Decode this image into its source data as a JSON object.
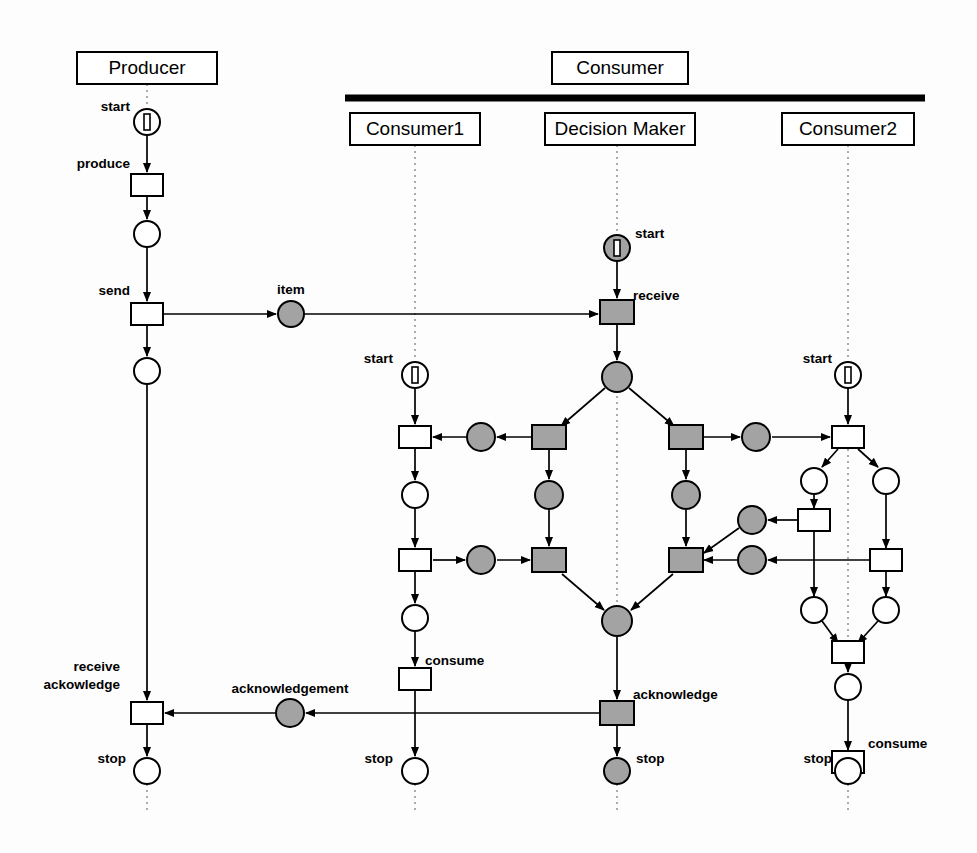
{
  "diagram": {
    "type": "petri-net",
    "colors": {
      "gray_fill": "#a3a3a3",
      "white_fill": "#ffffff",
      "stroke": "#000000",
      "lifeline": "#888888"
    }
  },
  "lanes": [
    {
      "id": "producer",
      "label": "Producer",
      "x": 147,
      "y": 68,
      "w": 140,
      "h": 32
    },
    {
      "id": "consumer",
      "label": "Consumer",
      "x": 620,
      "y": 68,
      "w": 136,
      "h": 32
    },
    {
      "id": "consumer1",
      "label": "Consumer1",
      "x": 415,
      "y": 129,
      "w": 130,
      "h": 32
    },
    {
      "id": "decision-maker",
      "label": "Decision Maker",
      "x": 620,
      "y": 129,
      "w": 150,
      "h": 32
    },
    {
      "id": "consumer2",
      "label": "Consumer2",
      "x": 848,
      "y": 129,
      "w": 132,
      "h": 32
    }
  ],
  "consumer_bar": {
    "x1": 345,
    "x2": 925,
    "y": 98,
    "thickness": 7
  },
  "labels": [
    {
      "id": "producer-start",
      "text": "start",
      "x": 130,
      "y": 111,
      "align": "end"
    },
    {
      "id": "producer-produce",
      "text": "produce",
      "x": 130,
      "y": 168,
      "align": "end"
    },
    {
      "id": "producer-send",
      "text": "send",
      "x": 130,
      "y": 295,
      "align": "end"
    },
    {
      "id": "item-place",
      "text": "item",
      "x": 291,
      "y": 294,
      "align": "middle"
    },
    {
      "id": "dm-start",
      "text": "start",
      "x": 635,
      "y": 238,
      "align": "start"
    },
    {
      "id": "dm-receive",
      "text": "receive",
      "x": 633,
      "y": 300,
      "align": "start"
    },
    {
      "id": "c1-start",
      "text": "start",
      "x": 393,
      "y": 363,
      "align": "end"
    },
    {
      "id": "c2-start",
      "text": "start",
      "x": 832,
      "y": 363,
      "align": "end"
    },
    {
      "id": "c1-consume",
      "text": "consume",
      "x": 425,
      "y": 665,
      "align": "start"
    },
    {
      "id": "c2-consume",
      "text": "consume",
      "x": 868,
      "y": 748,
      "align": "start"
    },
    {
      "id": "prod-receive-ack-1",
      "text": "receive",
      "x": 120,
      "y": 671,
      "align": "end"
    },
    {
      "id": "prod-receive-ack-2",
      "text": "ackowledge",
      "x": 120,
      "y": 689,
      "align": "end"
    },
    {
      "id": "ack-place",
      "text": "acknowledgement",
      "x": 290,
      "y": 693,
      "align": "middle"
    },
    {
      "id": "dm-acknowledge",
      "text": "acknowledge",
      "x": 633,
      "y": 699,
      "align": "start"
    },
    {
      "id": "prod-stop",
      "text": "stop",
      "x": 126,
      "y": 763,
      "align": "end"
    },
    {
      "id": "c1-stop",
      "text": "stop",
      "x": 393,
      "y": 763,
      "align": "end"
    },
    {
      "id": "dm-stop",
      "text": "stop",
      "x": 636,
      "y": 763,
      "align": "start"
    },
    {
      "id": "c2-stop",
      "text": "stop",
      "x": 832,
      "y": 763,
      "align": "end"
    }
  ],
  "lifelines": [
    {
      "id": "lifeline-producer",
      "x": 147,
      "y1": 84,
      "y2": 104
    },
    {
      "id": "lifeline-consumer1",
      "x": 415,
      "y1": 145,
      "y2": 372
    },
    {
      "id": "lifeline-dm",
      "x": 617,
      "y1": 145,
      "y2": 248
    },
    {
      "id": "lifeline-consumer2",
      "x": 848,
      "y1": 145,
      "y2": 372
    },
    {
      "id": "lifeline-dm-mid",
      "x": 617,
      "y1": 378,
      "y2": 624
    },
    {
      "id": "lifeline-c2-mid",
      "x": 848,
      "y1": 443,
      "y2": 652
    },
    {
      "id": "lifeline-prod-end",
      "x": 147,
      "y1": 784,
      "y2": 812
    },
    {
      "id": "lifeline-c1-end",
      "x": 415,
      "y1": 784,
      "y2": 812
    },
    {
      "id": "lifeline-dm-end",
      "x": 617,
      "y1": 784,
      "y2": 812
    },
    {
      "id": "lifeline-c2-end",
      "x": 848,
      "y1": 784,
      "y2": 812
    }
  ],
  "places": [
    {
      "id": "p-prod-start",
      "cx": 147,
      "cy": 122,
      "r": 13,
      "fill": "white",
      "token": "bar"
    },
    {
      "id": "p-prod-1",
      "cx": 147,
      "cy": 234,
      "r": 13,
      "fill": "white",
      "token": "none"
    },
    {
      "id": "p-prod-2",
      "cx": 147,
      "cy": 371,
      "r": 13,
      "fill": "white",
      "token": "none"
    },
    {
      "id": "p-item",
      "cx": 291,
      "cy": 314,
      "r": 13,
      "fill": "gray",
      "token": "none"
    },
    {
      "id": "p-dm-start",
      "cx": 617,
      "cy": 248,
      "r": 13,
      "fill": "gray",
      "token": "bar"
    },
    {
      "id": "p-dm-fork",
      "cx": 617,
      "cy": 377,
      "r": 15,
      "fill": "gray",
      "token": "none"
    },
    {
      "id": "p-c1-start",
      "cx": 415,
      "cy": 375,
      "r": 13,
      "fill": "white",
      "token": "bar"
    },
    {
      "id": "p-c2-start",
      "cx": 848,
      "cy": 375,
      "r": 13,
      "fill": "white",
      "token": "bar"
    },
    {
      "id": "p-c1-a",
      "cx": 481,
      "cy": 437,
      "r": 14,
      "fill": "gray",
      "token": "none"
    },
    {
      "id": "p-c1-b",
      "cx": 415,
      "cy": 495,
      "r": 13,
      "fill": "white",
      "token": "none"
    },
    {
      "id": "p-c1-c",
      "cx": 481,
      "cy": 560,
      "r": 14,
      "fill": "gray",
      "token": "none"
    },
    {
      "id": "p-c1-d",
      "cx": 415,
      "cy": 618,
      "r": 13,
      "fill": "white",
      "token": "none"
    },
    {
      "id": "p-dm-l-mid",
      "cx": 549,
      "cy": 495,
      "r": 14,
      "fill": "gray",
      "token": "none"
    },
    {
      "id": "p-dm-r-mid",
      "cx": 686,
      "cy": 495,
      "r": 14,
      "fill": "gray",
      "token": "none"
    },
    {
      "id": "p-c2-a",
      "cx": 756,
      "cy": 437,
      "r": 14,
      "fill": "gray",
      "token": "none"
    },
    {
      "id": "p-c2-b",
      "cx": 752,
      "cy": 520,
      "r": 14,
      "fill": "gray",
      "token": "none"
    },
    {
      "id": "p-c2-c",
      "cx": 752,
      "cy": 560,
      "r": 14,
      "fill": "gray",
      "token": "none"
    },
    {
      "id": "p-c2-l1",
      "cx": 814,
      "cy": 481,
      "r": 13,
      "fill": "white",
      "token": "none"
    },
    {
      "id": "p-c2-r1",
      "cx": 886,
      "cy": 481,
      "r": 13,
      "fill": "white",
      "token": "none"
    },
    {
      "id": "p-c2-l2",
      "cx": 814,
      "cy": 610,
      "r": 13,
      "fill": "white",
      "token": "none"
    },
    {
      "id": "p-c2-r2",
      "cx": 886,
      "cy": 610,
      "r": 13,
      "fill": "white",
      "token": "none"
    },
    {
      "id": "p-c2-join",
      "cx": 848,
      "cy": 687,
      "r": 13,
      "fill": "white",
      "token": "none"
    },
    {
      "id": "p-dm-join",
      "cx": 617,
      "cy": 621,
      "r": 15,
      "fill": "gray",
      "token": "none"
    },
    {
      "id": "p-ack",
      "cx": 290,
      "cy": 713,
      "r": 14,
      "fill": "gray",
      "token": "none"
    },
    {
      "id": "p-prod-stop",
      "cx": 147,
      "cy": 771,
      "r": 13,
      "fill": "white",
      "token": "none"
    },
    {
      "id": "p-c1-stop",
      "cx": 415,
      "cy": 771,
      "r": 13,
      "fill": "white",
      "token": "none"
    },
    {
      "id": "p-dm-stop",
      "cx": 617,
      "cy": 771,
      "r": 13,
      "fill": "gray",
      "token": "none"
    },
    {
      "id": "p-c2-stop",
      "cx": 848,
      "cy": 771,
      "r": 13,
      "fill": "white",
      "token": "none"
    }
  ],
  "transitions": [
    {
      "id": "t-produce",
      "cx": 147,
      "cy": 185,
      "w": 32,
      "h": 22,
      "fill": "white"
    },
    {
      "id": "t-send",
      "cx": 147,
      "cy": 314,
      "w": 32,
      "h": 22,
      "fill": "white"
    },
    {
      "id": "t-receive",
      "cx": 617,
      "cy": 312,
      "w": 34,
      "h": 24,
      "fill": "gray"
    },
    {
      "id": "t-c1-1",
      "cx": 415,
      "cy": 437,
      "w": 32,
      "h": 22,
      "fill": "white"
    },
    {
      "id": "t-c1-2",
      "cx": 415,
      "cy": 560,
      "w": 32,
      "h": 22,
      "fill": "white"
    },
    {
      "id": "t-dm-l-top",
      "cx": 549,
      "cy": 437,
      "w": 34,
      "h": 24,
      "fill": "gray"
    },
    {
      "id": "t-dm-l-bot",
      "cx": 549,
      "cy": 560,
      "w": 34,
      "h": 24,
      "fill": "gray"
    },
    {
      "id": "t-dm-r-top",
      "cx": 686,
      "cy": 437,
      "w": 34,
      "h": 24,
      "fill": "gray"
    },
    {
      "id": "t-dm-r-bot",
      "cx": 686,
      "cy": 560,
      "w": 34,
      "h": 24,
      "fill": "gray"
    },
    {
      "id": "t-c2-1",
      "cx": 848,
      "cy": 437,
      "w": 32,
      "h": 22,
      "fill": "white"
    },
    {
      "id": "t-c2-left",
      "cx": 814,
      "cy": 520,
      "w": 32,
      "h": 22,
      "fill": "white"
    },
    {
      "id": "t-c2-right",
      "cx": 886,
      "cy": 560,
      "w": 32,
      "h": 22,
      "fill": "white"
    },
    {
      "id": "t-c2-join",
      "cx": 848,
      "cy": 652,
      "w": 32,
      "h": 22,
      "fill": "white"
    },
    {
      "id": "t-c1-consume",
      "cx": 415,
      "cy": 679,
      "w": 32,
      "h": 22,
      "fill": "white"
    },
    {
      "id": "t-c2-consume",
      "cx": 848,
      "cy": 762,
      "w": 32,
      "h": 22,
      "fill": "white"
    },
    {
      "id": "t-dm-ack",
      "cx": 617,
      "cy": 713,
      "w": 34,
      "h": 24,
      "fill": "gray"
    },
    {
      "id": "t-prod-recack",
      "cx": 147,
      "cy": 713,
      "w": 32,
      "h": 22,
      "fill": "white"
    }
  ],
  "arcs": [
    {
      "id": "a-prodstart-produce",
      "d": "M147,135 L147,172",
      "arrow": true
    },
    {
      "id": "a-produce-p1",
      "d": "M147,196 L147,219",
      "arrow": true
    },
    {
      "id": "a-p1-send",
      "d": "M147,247 L147,301",
      "arrow": true
    },
    {
      "id": "a-send-p2",
      "d": "M147,325 L147,356",
      "arrow": true
    },
    {
      "id": "a-send-item",
      "d": "M163,314 L276,314",
      "arrow": true
    },
    {
      "id": "a-item-receive",
      "d": "M304,314 L598,314",
      "arrow": true
    },
    {
      "id": "a-dmstart-receive",
      "d": "M617,261 L617,298",
      "arrow": true
    },
    {
      "id": "a-receive-fork",
      "d": "M617,324 L617,360",
      "arrow": true
    },
    {
      "id": "a-p2-recack",
      "d": "M147,384 L147,700",
      "arrow": true
    },
    {
      "id": "a-fork-dmltop",
      "d": "M605,388 L561,426",
      "arrow": true
    },
    {
      "id": "a-fork-dmrtop",
      "d": "M629,388 L674,426",
      "arrow": true
    },
    {
      "id": "a-dmltop-pc1a",
      "d": "M532,437 L497,437",
      "arrow": true
    },
    {
      "id": "a-pc1a-tc11",
      "d": "M466,437 L433,437",
      "arrow": true
    },
    {
      "id": "a-c1start-tc11",
      "d": "M415,388 L415,424",
      "arrow": true
    },
    {
      "id": "a-tc11-pc1b",
      "d": "M415,448 L415,480",
      "arrow": true
    },
    {
      "id": "a-pc1b-tc12",
      "d": "M415,508 L415,547",
      "arrow": true
    },
    {
      "id": "a-tc12-pc1c",
      "d": "M433,560 L465,560",
      "arrow": true
    },
    {
      "id": "a-pc1c-dmlbot",
      "d": "M497,560 L530,560",
      "arrow": true
    },
    {
      "id": "a-dmltop-pdmlmid",
      "d": "M549,450 L549,479",
      "arrow": true
    },
    {
      "id": "a-pdmlmid-dmlbot",
      "d": "M549,510 L549,546",
      "arrow": true
    },
    {
      "id": "a-tc12-pc1d",
      "d": "M415,572 L415,603",
      "arrow": true
    },
    {
      "id": "a-pc1d-consume",
      "d": "M415,632 L415,666",
      "arrow": true
    },
    {
      "id": "a-consume-c1stop",
      "d": "M415,691 L415,756",
      "arrow": true
    },
    {
      "id": "a-dmrtop-pdmrmid",
      "d": "M686,450 L686,479",
      "arrow": true
    },
    {
      "id": "a-pdmrmid-dmrbot",
      "d": "M686,510 L686,546",
      "arrow": true
    },
    {
      "id": "a-dmrtop-pc2a",
      "d": "M704,437 L740,437",
      "arrow": true
    },
    {
      "id": "a-pc2a-tc21",
      "d": "M772,437 L830,437",
      "arrow": true
    },
    {
      "id": "a-c2start-tc21",
      "d": "M848,388 L848,424",
      "arrow": true
    },
    {
      "id": "a-dmlbot-join",
      "d": "M562,574 L604,610",
      "arrow": true
    },
    {
      "id": "a-dmrbot-join",
      "d": "M673,574 L631,610",
      "arrow": true
    },
    {
      "id": "a-join-dmack",
      "d": "M617,637 L617,699",
      "arrow": true
    },
    {
      "id": "a-dmack-dmstop",
      "d": "M617,726 L617,756",
      "arrow": true
    },
    {
      "id": "a-dmack-ackp",
      "d": "M599,713 L306,713",
      "arrow": true
    },
    {
      "id": "a-ackp-recack",
      "d": "M275,713 L165,713",
      "arrow": true
    },
    {
      "id": "a-recack-prodstop",
      "d": "M147,725 L147,756",
      "arrow": true
    },
    {
      "id": "a-tc21-pc2l1",
      "d": "M838,449 L822,467",
      "arrow": true
    },
    {
      "id": "a-tc21-pc2r1",
      "d": "M858,449 L878,467",
      "arrow": true
    },
    {
      "id": "a-pc2l1-tc2left",
      "d": "M814,495 L814,508",
      "arrow": true
    },
    {
      "id": "a-pc2r1-tc2right",
      "d": "M886,495 L886,548",
      "arrow": true
    },
    {
      "id": "a-tc2left-pc2b",
      "d": "M797,520 L768,520",
      "arrow": true
    },
    {
      "id": "a-pc2b-dmrbot",
      "d": "M739,528 L704,553",
      "arrow": true
    },
    {
      "id": "a-tc2right-pc2c",
      "d": "M869,560 L768,560",
      "arrow": true
    },
    {
      "id": "a-pc2c-dmrbot",
      "d": "M737,560 L704,560",
      "arrow": true
    },
    {
      "id": "a-tc2left-pc2l2",
      "d": "M814,532 L814,596",
      "arrow": true
    },
    {
      "id": "a-tc2right-pc2r2",
      "d": "M886,572 L886,596",
      "arrow": true
    },
    {
      "id": "a-pc2l2-tc2join",
      "d": "M822,621 L838,643",
      "arrow": true
    },
    {
      "id": "a-pc2r2-tc2join",
      "d": "M878,621 L858,643",
      "arrow": true
    },
    {
      "id": "a-tc2join-pjoin",
      "d": "M848,664 L848,672",
      "arrow": true
    },
    {
      "id": "a-pjoin-c2consume",
      "d": "M848,701 L848,750",
      "arrow": true
    },
    {
      "id": "a-c2consume-c2stop",
      "d": "M848,774 L848,756",
      "arrow": true
    }
  ]
}
